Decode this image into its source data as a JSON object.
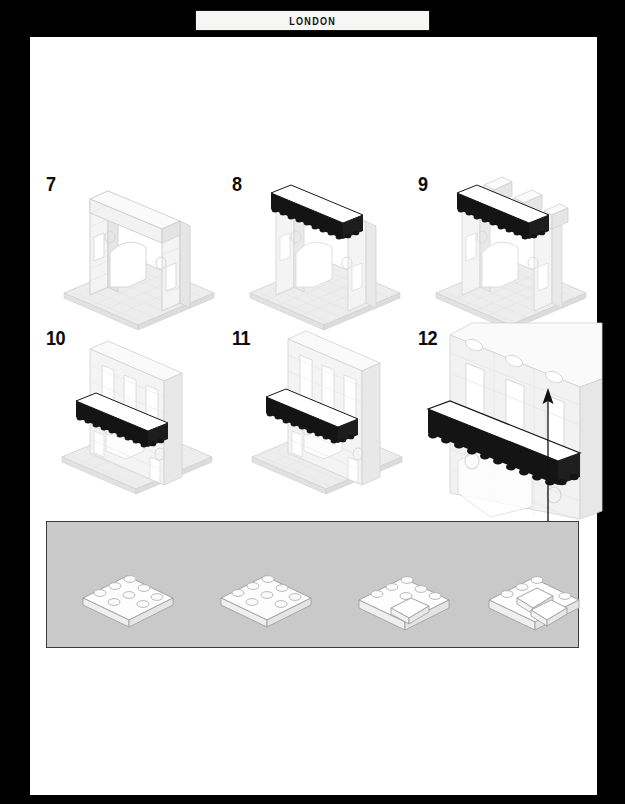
{
  "header": {
    "title": "LONDON"
  },
  "page": {
    "background_color": "#000000",
    "sheet_color": "#ffffff",
    "ink_color": "#0b0b0b"
  },
  "palette": {
    "brick_white": "#f2f2f2",
    "brick_outline": "#c8c8c8",
    "brick_black": "#141414",
    "baseplate": "#ededed",
    "parts_bin_bg": "#c9c9c9",
    "parts_bin_border": "#3a3a3a",
    "arrow": "#111111"
  },
  "steps": [
    {
      "number": "7",
      "name": "step-7",
      "description": "Light gray arched facade with two side windows standing on a baseplate"
    },
    {
      "number": "8",
      "name": "step-8",
      "description": "Black cornice beam added across the top of the arch facade"
    },
    {
      "number": "9",
      "name": "step-9",
      "description": "White blocks added on top of the black cornice beam"
    },
    {
      "number": "10",
      "name": "step-10",
      "description": "Wall extended upward with tall window openings above the black cornice"
    },
    {
      "number": "11",
      "name": "step-11",
      "description": "Upper storey completed with three tall window openings"
    },
    {
      "number": "12",
      "name": "step-12",
      "description": "Close-up detail view of the facade upper storey with callout arrow to the parts bin"
    }
  ],
  "parts_bin": {
    "name": "parts-bin",
    "background_color": "#c9c9c9",
    "parts": [
      {
        "name": "plate-2x4-white",
        "color": "white",
        "studs": 8,
        "shape": "plate 2x4"
      },
      {
        "name": "plate-2x4-white",
        "color": "white",
        "studs": 8,
        "shape": "plate 2x4"
      },
      {
        "name": "plate-with-slope-white",
        "color": "white",
        "studs": 8,
        "shape": "plate 2x4 with slope"
      },
      {
        "name": "plate-with-double-slope-white",
        "color": "white",
        "studs": 8,
        "shape": "plate 2x4 with two slopes"
      }
    ]
  },
  "callout": {
    "name": "parts-callout-arrow",
    "direction": "up",
    "from": "parts-bin",
    "to": "step-12"
  }
}
